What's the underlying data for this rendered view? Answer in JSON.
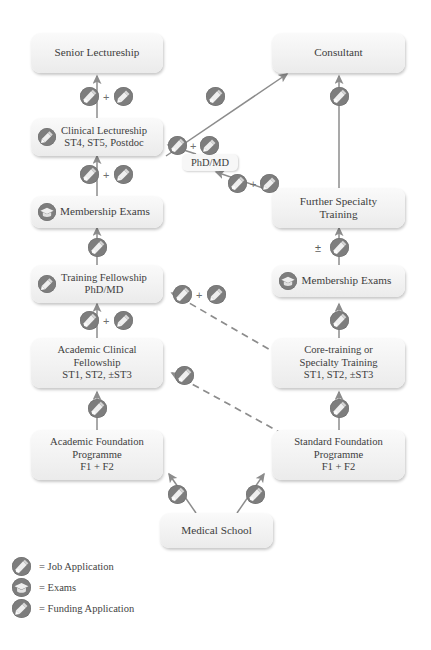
{
  "diagram": {
    "colors": {
      "icon_fill": "#7d7d7d",
      "arrow": "#8c8c8c",
      "node_bg": "#f2f2f2",
      "text": "#3d3d3d"
    },
    "plus_symbol": "+",
    "plus_minus_symbol": "±"
  },
  "nodes": [
    {
      "id": "senior-lectureship",
      "label": "Senior Lectureship",
      "lines": [
        "Senior Lectureship"
      ],
      "badge": "none"
    },
    {
      "id": "consultant",
      "label": "Consultant",
      "lines": [
        "Consultant"
      ],
      "badge": "none"
    },
    {
      "id": "clinical-lectureship",
      "label": "Clinical Lectureship ST4, ST5, Postdoc",
      "lines": [
        "Clinical Lectureship",
        "ST4, ST5, Postdoc"
      ],
      "badge": "funding-application-icon"
    },
    {
      "id": "phd-md",
      "label": "PhD/MD",
      "lines": [
        "PhD/MD"
      ],
      "badge": "none"
    },
    {
      "id": "further-specialty-training",
      "label": "Further Specialty Training",
      "lines": [
        "Further Specialty",
        "Training"
      ],
      "badge": "none"
    },
    {
      "id": "membership-exams-left",
      "label": "Membership Exams",
      "lines": [
        "Membership Exams"
      ],
      "badge": "exams-icon"
    },
    {
      "id": "membership-exams-right",
      "label": "Membership Exams",
      "lines": [
        "Membership Exams"
      ],
      "badge": "exams-icon"
    },
    {
      "id": "training-fellowship",
      "label": "Training Fellowship PhD/MD",
      "lines": [
        "Training Fellowship",
        "PhD/MD"
      ],
      "badge": "funding-application-icon"
    },
    {
      "id": "core-training",
      "label": "Core-training or Specialty Training ST1, ST2, ±ST3",
      "lines": [
        "Core-training or",
        "Specialty Training",
        "ST1, ST2, ±ST3"
      ],
      "badge": "none"
    },
    {
      "id": "academic-clinical-fellowship",
      "label": "Academic Clinical Fellowship ST1, ST2, ±ST3",
      "lines": [
        "Academic Clinical",
        "Fellowship",
        "ST1, ST2, ±ST3"
      ],
      "badge": "none"
    },
    {
      "id": "academic-foundation-programme",
      "label": "Academic Foundation Programme F1 + F2",
      "lines": [
        "Academic Foundation",
        "Programme",
        "F1 + F2"
      ],
      "badge": "none"
    },
    {
      "id": "standard-foundation-programme",
      "label": "Standard Foundation Programme F1 + F2",
      "lines": [
        "Standard Foundation",
        "Programme",
        "F1 + F2"
      ],
      "badge": "none"
    },
    {
      "id": "medical-school",
      "label": "Medical School",
      "lines": [
        "Medical School"
      ],
      "badge": "none"
    }
  ],
  "legend": {
    "items": [
      {
        "icon": "job-application-icon",
        "text": "= Job Application"
      },
      {
        "icon": "exams-icon",
        "text": "= Exams"
      },
      {
        "icon": "funding-application-icon",
        "text": "= Funding Application"
      }
    ]
  }
}
